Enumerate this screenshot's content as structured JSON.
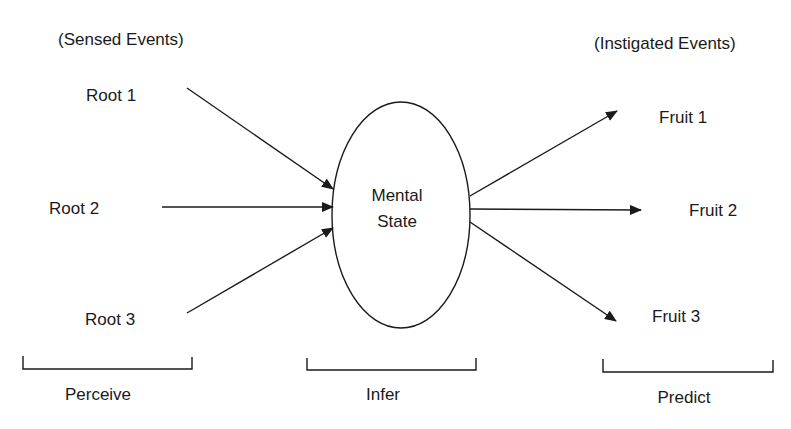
{
  "diagram": {
    "sensed_header": "(Sensed Events)",
    "instigated_header": "(Instigated Events)",
    "center": {
      "line1": "Mental",
      "line2": "State"
    },
    "roots": [
      {
        "label": "Root 1"
      },
      {
        "label": "Root 2"
      },
      {
        "label": "Root 3"
      }
    ],
    "fruits": [
      {
        "label": "Fruit 1"
      },
      {
        "label": "Fruit 2"
      },
      {
        "label": "Fruit 3"
      }
    ],
    "stages": [
      {
        "label": "Perceive"
      },
      {
        "label": "Infer"
      },
      {
        "label": "Predict"
      }
    ],
    "colors": {
      "stroke": "#1a1a1a",
      "background": "#ffffff"
    }
  }
}
